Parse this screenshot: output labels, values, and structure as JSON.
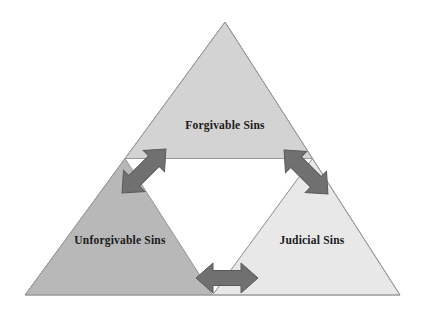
{
  "diagram": {
    "type": "triangle-partition-diagram",
    "background_color": "#ffffff",
    "outer_triangle": {
      "name": "outer-triangle",
      "apex": [
        225,
        22
      ],
      "bottom_left": [
        25,
        295
      ],
      "bottom_right": [
        400,
        295
      ],
      "stroke_color": "#9a9a9a"
    },
    "center_region": {
      "name": "center-inverted-triangle",
      "fill_color": "#ffffff",
      "stroke_color": "#9a9a9a"
    },
    "segments": [
      {
        "id": "forgivable",
        "label": "Forgivable Sins",
        "fill_color": "#d3d3d3",
        "stroke_color": "#9a9a9a",
        "points": "225,22 125,158.5 312.5,158.5",
        "label_x": 225,
        "label_y": 126
      },
      {
        "id": "unforgivable",
        "label": "Unforgivable Sins",
        "fill_color": "#b8b8b8",
        "stroke_color": "#9a9a9a",
        "points": "125,158.5 25,295 212.5,295",
        "label_x": 120,
        "label_y": 241
      },
      {
        "id": "judicial",
        "label": "Judicial Sins",
        "fill_color": "#e8e8e8",
        "stroke_color": "#9a9a9a",
        "points": "312.5,158.5 212.5,295 400,295",
        "label_x": 312,
        "label_y": 241
      }
    ],
    "arrows": [
      {
        "id": "forgivable-unforgivable",
        "name": "double-arrow-forgivable-unforgivable",
        "connects": [
          "Forgivable Sins",
          "Unforgivable Sins"
        ],
        "direction": "diagonal-up-right",
        "color": "#707070",
        "stroke_color": "#5a5a5a",
        "center_x": 144,
        "center_y": 171,
        "rotation_deg": -45
      },
      {
        "id": "forgivable-judicial",
        "name": "double-arrow-forgivable-judicial",
        "connects": [
          "Forgivable Sins",
          "Judicial Sins"
        ],
        "direction": "diagonal-down-right",
        "color": "#707070",
        "stroke_color": "#5a5a5a",
        "center_x": 306,
        "center_y": 172,
        "rotation_deg": 45
      },
      {
        "id": "unforgivable-judicial",
        "name": "double-arrow-unforgivable-judicial",
        "connects": [
          "Unforgivable Sins",
          "Judicial Sins"
        ],
        "direction": "horizontal",
        "color": "#707070",
        "stroke_color": "#5a5a5a",
        "center_x": 227,
        "center_y": 278,
        "rotation_deg": 0
      }
    ]
  }
}
